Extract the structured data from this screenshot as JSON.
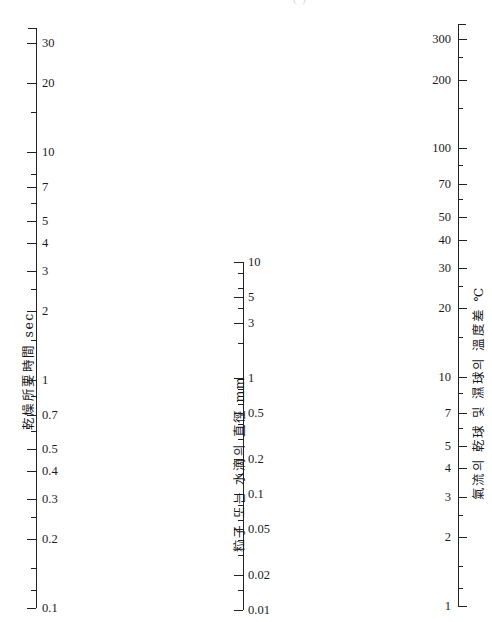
{
  "figure": {
    "type": "nomogram",
    "clipped_header": "(            )",
    "width": 492,
    "height": 622,
    "background": "#ffffff",
    "ink": "#1a1a1a"
  },
  "chart_data": {
    "type": "line",
    "title": "",
    "subtitle": "",
    "xlabel": "",
    "ylabel": "",
    "grid": false,
    "legend": null,
    "axes": [
      {
        "id": "drying-time",
        "position": "left",
        "title": "乾燥所要時間 sec",
        "unit": "sec",
        "scale": "log",
        "range": [
          0.1,
          35
        ],
        "x_px": 36,
        "top_px": 28,
        "bottom_px": 608,
        "direction": "increasing-upward",
        "ticks": [
          {
            "value": 35,
            "label": "",
            "type": "cap"
          },
          {
            "value": 30,
            "label": "30",
            "type": "major"
          },
          {
            "value": 20,
            "label": "20",
            "type": "major"
          },
          {
            "value": 15,
            "label": "",
            "type": "minor"
          },
          {
            "value": 10,
            "label": "10",
            "type": "major"
          },
          {
            "value": 8,
            "label": "",
            "type": "minor"
          },
          {
            "value": 7,
            "label": "7",
            "type": "major"
          },
          {
            "value": 6,
            "label": "",
            "type": "minor"
          },
          {
            "value": 5,
            "label": "5",
            "type": "major"
          },
          {
            "value": 4,
            "label": "4",
            "type": "major"
          },
          {
            "value": 3,
            "label": "3",
            "type": "major"
          },
          {
            "value": 2.5,
            "label": "",
            "type": "minor"
          },
          {
            "value": 2,
            "label": "2",
            "type": "major"
          },
          {
            "value": 1.5,
            "label": "",
            "type": "minor"
          },
          {
            "value": 1,
            "label": "1",
            "type": "major"
          },
          {
            "value": 0.85,
            "label": "",
            "type": "minor"
          },
          {
            "value": 0.7,
            "label": "0.7",
            "type": "major"
          },
          {
            "value": 0.6,
            "label": "",
            "type": "minor"
          },
          {
            "value": 0.5,
            "label": "0.5",
            "type": "major"
          },
          {
            "value": 0.4,
            "label": "0.4",
            "type": "major"
          },
          {
            "value": 0.3,
            "label": "0.3",
            "type": "major"
          },
          {
            "value": 0.25,
            "label": "",
            "type": "minor"
          },
          {
            "value": 0.2,
            "label": "0.2",
            "type": "major"
          },
          {
            "value": 0.15,
            "label": "",
            "type": "minor"
          },
          {
            "value": 0.12,
            "label": "",
            "type": "minor"
          },
          {
            "value": 0.1,
            "label": "0.1",
            "type": "major"
          }
        ]
      },
      {
        "id": "particle-diameter",
        "position": "middle",
        "title": "粒子 또는 水滴의 直徑 mm",
        "unit": "mm",
        "scale": "log",
        "range": [
          0.01,
          10
        ],
        "x_px": 243,
        "top_px": 262,
        "bottom_px": 610,
        "direction": "increasing-upward",
        "ticks": [
          {
            "value": 10,
            "label": "10",
            "type": "major"
          },
          {
            "value": 8,
            "label": "",
            "type": "minor"
          },
          {
            "value": 6,
            "label": "",
            "type": "minor"
          },
          {
            "value": 5,
            "label": "5",
            "type": "major"
          },
          {
            "value": 4,
            "label": "",
            "type": "minor"
          },
          {
            "value": 3,
            "label": "3",
            "type": "major"
          },
          {
            "value": 2,
            "label": "",
            "type": "minor"
          },
          {
            "value": 1,
            "label": "1",
            "type": "major"
          },
          {
            "value": 0.8,
            "label": "",
            "type": "minor"
          },
          {
            "value": 0.6,
            "label": "",
            "type": "minor"
          },
          {
            "value": 0.5,
            "label": "0.5",
            "type": "major"
          },
          {
            "value": 0.4,
            "label": "",
            "type": "minor"
          },
          {
            "value": 0.3,
            "label": "",
            "type": "minor"
          },
          {
            "value": 0.2,
            "label": "0.2",
            "type": "major"
          },
          {
            "value": 0.15,
            "label": "",
            "type": "minor"
          },
          {
            "value": 0.1,
            "label": "0.1",
            "type": "major"
          },
          {
            "value": 0.08,
            "label": "",
            "type": "minor"
          },
          {
            "value": 0.06,
            "label": "",
            "type": "minor"
          },
          {
            "value": 0.05,
            "label": "0.05",
            "type": "major"
          },
          {
            "value": 0.04,
            "label": "",
            "type": "minor"
          },
          {
            "value": 0.03,
            "label": "",
            "type": "minor"
          },
          {
            "value": 0.02,
            "label": "0.02",
            "type": "major"
          },
          {
            "value": 0.015,
            "label": "",
            "type": "minor"
          },
          {
            "value": 0.01,
            "label": "0.01",
            "type": "major"
          }
        ]
      },
      {
        "id": "temperature-difference",
        "position": "right",
        "title": "氣流의 乾球 및 濕球의 溫度差 ℃",
        "unit": "℃",
        "scale": "log",
        "range": [
          1,
          350
        ],
        "x_px": 458,
        "top_px": 24,
        "bottom_px": 606,
        "direction": "increasing-upward",
        "ticks": [
          {
            "value": 350,
            "label": "",
            "type": "cap"
          },
          {
            "value": 300,
            "label": "300",
            "type": "major"
          },
          {
            "value": 250,
            "label": "",
            "type": "minor"
          },
          {
            "value": 200,
            "label": "200",
            "type": "major"
          },
          {
            "value": 150,
            "label": "",
            "type": "minor"
          },
          {
            "value": 100,
            "label": "100",
            "type": "major"
          },
          {
            "value": 85,
            "label": "",
            "type": "minor"
          },
          {
            "value": 70,
            "label": "70",
            "type": "major"
          },
          {
            "value": 60,
            "label": "",
            "type": "minor"
          },
          {
            "value": 50,
            "label": "50",
            "type": "major"
          },
          {
            "value": 40,
            "label": "40",
            "type": "major"
          },
          {
            "value": 30,
            "label": "30",
            "type": "major"
          },
          {
            "value": 25,
            "label": "",
            "type": "minor"
          },
          {
            "value": 20,
            "label": "20",
            "type": "major"
          },
          {
            "value": 15,
            "label": "",
            "type": "minor"
          },
          {
            "value": 10,
            "label": "10",
            "type": "major"
          },
          {
            "value": 8.5,
            "label": "",
            "type": "minor"
          },
          {
            "value": 7,
            "label": "7",
            "type": "major"
          },
          {
            "value": 6,
            "label": "",
            "type": "minor"
          },
          {
            "value": 5,
            "label": "5",
            "type": "major"
          },
          {
            "value": 4,
            "label": "4",
            "type": "major"
          },
          {
            "value": 3,
            "label": "3",
            "type": "major"
          },
          {
            "value": 2.5,
            "label": "",
            "type": "minor"
          },
          {
            "value": 2,
            "label": "2",
            "type": "major"
          },
          {
            "value": 1.5,
            "label": "",
            "type": "minor"
          },
          {
            "value": 1.2,
            "label": "",
            "type": "minor"
          },
          {
            "value": 1,
            "label": "1",
            "type": "major"
          }
        ]
      }
    ]
  }
}
